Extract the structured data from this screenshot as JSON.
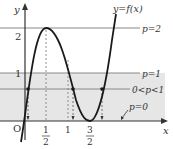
{
  "figure": {
    "curve_label": "y=f(x)",
    "axis_x_label": "x",
    "axis_y_label": "y",
    "origin_label": "O",
    "y_ticks": [
      "1",
      "2"
    ],
    "x_ticks": [
      {
        "num": "1",
        "den": "2"
      },
      {
        "whole": "1"
      },
      {
        "num": "3",
        "den": "2"
      }
    ],
    "lines": [
      {
        "label": "p=2",
        "value": 2
      },
      {
        "label": "p=1",
        "value": 1
      },
      {
        "label": "0<p<1",
        "value": 0.5
      },
      {
        "label": "p=0",
        "value": 0
      }
    ],
    "colors": {
      "band_fill": "#e6e6e6",
      "line": "#888888",
      "curve": "#1a1a1a",
      "text": "#333333"
    }
  }
}
